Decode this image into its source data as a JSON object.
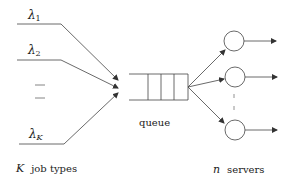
{
  "diagram": {
    "type": "queueing-system",
    "arrivals": [
      {
        "symbol": "λ",
        "subscript": "1"
      },
      {
        "symbol": "λ",
        "subscript": "2"
      },
      {
        "symbol": "λ",
        "subscript": "K"
      }
    ],
    "labels": {
      "queue": "queue",
      "job_types_var": "K",
      "job_types_text": "job types",
      "servers_var": "n",
      "servers_text": "servers"
    },
    "colors": {
      "stroke": "#333333",
      "text": "#222222",
      "background": "#ffffff"
    }
  }
}
